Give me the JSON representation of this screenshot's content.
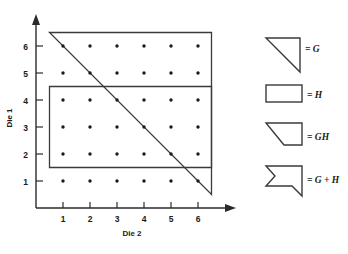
{
  "chart_data": {
    "type": "scatter",
    "title": "",
    "xlabel": "Die 2",
    "ylabel": "Die 1",
    "xlim": [
      0,
      7
    ],
    "ylim": [
      0,
      7
    ],
    "grid": false,
    "x_ticks": [
      "1",
      "2",
      "3",
      "4",
      "5",
      "6"
    ],
    "y_ticks": [
      "1",
      "2",
      "3",
      "4",
      "5",
      "6"
    ],
    "x_tick_values": [
      1,
      2,
      3,
      4,
      5,
      6
    ],
    "y_tick_values": [
      1,
      2,
      3,
      4,
      5,
      6
    ],
    "points": [
      {
        "x": 1,
        "y": 1
      },
      {
        "x": 2,
        "y": 1
      },
      {
        "x": 3,
        "y": 1
      },
      {
        "x": 4,
        "y": 1
      },
      {
        "x": 5,
        "y": 1
      },
      {
        "x": 6,
        "y": 1
      },
      {
        "x": 1,
        "y": 2
      },
      {
        "x": 2,
        "y": 2
      },
      {
        "x": 3,
        "y": 2
      },
      {
        "x": 4,
        "y": 2
      },
      {
        "x": 5,
        "y": 2
      },
      {
        "x": 6,
        "y": 2
      },
      {
        "x": 1,
        "y": 3
      },
      {
        "x": 2,
        "y": 3
      },
      {
        "x": 3,
        "y": 3
      },
      {
        "x": 4,
        "y": 3
      },
      {
        "x": 5,
        "y": 3
      },
      {
        "x": 6,
        "y": 3
      },
      {
        "x": 1,
        "y": 4
      },
      {
        "x": 2,
        "y": 4
      },
      {
        "x": 3,
        "y": 4
      },
      {
        "x": 4,
        "y": 4
      },
      {
        "x": 5,
        "y": 4
      },
      {
        "x": 6,
        "y": 4
      },
      {
        "x": 1,
        "y": 5
      },
      {
        "x": 2,
        "y": 5
      },
      {
        "x": 3,
        "y": 5
      },
      {
        "x": 4,
        "y": 5
      },
      {
        "x": 5,
        "y": 5
      },
      {
        "x": 6,
        "y": 5
      },
      {
        "x": 1,
        "y": 6
      },
      {
        "x": 2,
        "y": 6
      },
      {
        "x": 3,
        "y": 6
      },
      {
        "x": 4,
        "y": 6
      },
      {
        "x": 5,
        "y": 6
      },
      {
        "x": 6,
        "y": 6
      }
    ],
    "regions": [
      {
        "name": "G",
        "shape": "triangle",
        "description": "Right triangle: event G, sum of dice is 7 or more",
        "vertices": [
          [
            0.5,
            6.5
          ],
          [
            6.5,
            6.5
          ],
          [
            6.5,
            0.5
          ]
        ]
      },
      {
        "name": "H",
        "shape": "rectangle",
        "description": "Rectangle: event H, Die 1 between 2 and 4",
        "vertices": [
          [
            0.5,
            1.5
          ],
          [
            6.5,
            1.5
          ],
          [
            6.5,
            4.5
          ],
          [
            0.5,
            4.5
          ]
        ]
      }
    ],
    "annotations": []
  },
  "legend": {
    "position": "right",
    "items": [
      {
        "icon": "triangle-region-icon",
        "label": "= G"
      },
      {
        "icon": "rectangle-region-icon",
        "label": "= H"
      },
      {
        "icon": "intersection-region-icon",
        "label": "= GH"
      },
      {
        "icon": "union-region-icon",
        "label": "= G + H"
      }
    ]
  },
  "colors": {
    "ink": "#1a1a1a",
    "stroke": "#3a3a3a",
    "background": "#ffffff"
  }
}
